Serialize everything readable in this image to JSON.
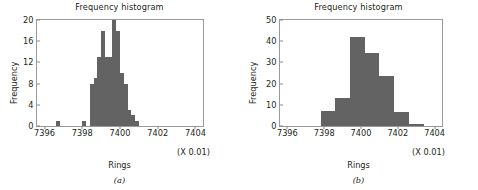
{
  "figure": {
    "panels": [
      {
        "caption": "(a)",
        "title": "Frequency histogram",
        "xlabel": "Rings",
        "ylabel": "Frequency",
        "scale_note": "(X 0.01)"
      },
      {
        "caption": "(b)",
        "title": "Frequency histogram",
        "xlabel": "Rings",
        "ylabel": "Frequency",
        "scale_note": "(X 0.01)"
      }
    ]
  },
  "chart_data": [
    {
      "type": "bar",
      "title": "Frequency histogram",
      "xlabel": "Rings",
      "ylabel": "Frequency",
      "annotation": "(X 0.01)",
      "grid": false,
      "legend": null,
      "xlim": [
        7395.6,
        7404.4
      ],
      "ylim": [
        0,
        20
      ],
      "xticks": [
        7396,
        7398,
        7400,
        7402,
        7404
      ],
      "xtick_labels": [
        "7396",
        "7398",
        "7400",
        "7402",
        "7404"
      ],
      "yticks": [
        0,
        4,
        8,
        12,
        16,
        20
      ],
      "ytick_labels": [
        "0",
        "4",
        "8",
        "12",
        "16",
        "20"
      ],
      "bin_width": 0.2,
      "bin_left_edges": [
        7396.6,
        7398.0,
        7398.4,
        7398.6,
        7398.8,
        7399.0,
        7399.2,
        7399.4,
        7399.6,
        7399.8,
        7400.0,
        7400.2,
        7400.4,
        7400.6,
        7400.8,
        7401.0,
        7401.2,
        7401.4,
        7402.8
      ],
      "values": [
        1,
        1,
        8,
        9,
        13,
        18,
        13,
        13,
        20,
        18,
        10,
        8,
        3,
        2,
        1
      ]
    },
    {
      "type": "bar",
      "title": "Frequency histogram",
      "xlabel": "Rings",
      "ylabel": "Frequency",
      "annotation": "(X 0.01)",
      "grid": false,
      "legend": null,
      "xlim": [
        7395.6,
        7404.4
      ],
      "ylim": [
        0,
        50
      ],
      "xticks": [
        7396,
        7398,
        7400,
        7402,
        7404
      ],
      "xtick_labels": [
        "7396",
        "7398",
        "7400",
        "7402",
        "7404"
      ],
      "yticks": [
        0,
        10,
        20,
        30,
        40,
        50
      ],
      "ytick_labels": [
        "0",
        "10",
        "20",
        "30",
        "40",
        "50"
      ],
      "bin_width": 0.8,
      "bin_left_edges": [
        7397.8,
        7398.6,
        7399.4,
        7400.2,
        7401.0,
        7401.8,
        7402.6
      ],
      "values": [
        7,
        13,
        42,
        34.5,
        23.5,
        6.5,
        1
      ]
    }
  ]
}
